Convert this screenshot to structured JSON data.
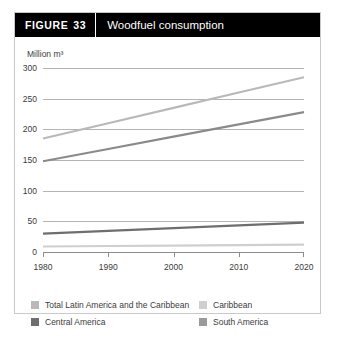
{
  "header": {
    "figure_word": "FIGURE",
    "figure_number": "33",
    "title": "Woodfuel consumption"
  },
  "chart_data": {
    "type": "line",
    "title": "Woodfuel consumption",
    "xlabel": "",
    "ylabel": "Million m³",
    "x": [
      1980,
      1990,
      2000,
      2010,
      2020
    ],
    "xlim": [
      1980,
      2020
    ],
    "ylim": [
      0,
      300
    ],
    "xticks": [
      "1980",
      "1990",
      "2000",
      "2010",
      "2020"
    ],
    "yticks": [
      "0",
      "50",
      "100",
      "150",
      "200",
      "250",
      "300"
    ],
    "grid": true,
    "legend_position": "bottom",
    "series": [
      {
        "name": "Total Latin America and the Caribbean",
        "color": "#b9b9b9",
        "values": [
          185,
          210,
          235,
          260,
          285
        ]
      },
      {
        "name": "South America",
        "color": "#8a8a8a",
        "values": [
          148,
          168,
          188,
          208,
          228
        ]
      },
      {
        "name": "Central America",
        "color": "#6e6e6e",
        "values": [
          30,
          34.5,
          39,
          43.5,
          48
        ]
      },
      {
        "name": "Caribbean",
        "color": "#cfcfcf",
        "values": [
          9,
          9.8,
          10.5,
          11.3,
          12
        ]
      }
    ]
  },
  "axis": {
    "y_title": "Million m³",
    "y_ticks": [
      "300",
      "250",
      "200",
      "150",
      "100",
      "50",
      "0"
    ],
    "x_ticks": [
      "1980",
      "1990",
      "2000",
      "2010",
      "2020"
    ]
  },
  "legend": {
    "items": [
      {
        "label": "Total Latin America and the Caribbean",
        "color": "#b9b9b9"
      },
      {
        "label": "Caribbean",
        "color": "#cfcfcf"
      },
      {
        "label": "Central America",
        "color": "#6e6e6e"
      },
      {
        "label": "South America",
        "color": "#9a9a9a"
      }
    ]
  }
}
